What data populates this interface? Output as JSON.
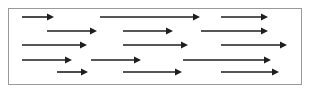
{
  "diagram": {
    "frame": {
      "x": 8,
      "y": 8,
      "width": 294,
      "height": 77,
      "border_color": "#9a9a9a"
    },
    "arrow_color": "#1e1e1e",
    "direction": "right",
    "rows": [
      {
        "y": 17,
        "arrows": [
          {
            "x1": 22,
            "x2": 54
          },
          {
            "x1": 100,
            "x2": 200
          },
          {
            "x1": 221,
            "x2": 268
          }
        ]
      },
      {
        "y": 31,
        "arrows": [
          {
            "x1": 47,
            "x2": 97
          },
          {
            "x1": 123,
            "x2": 173
          },
          {
            "x1": 201,
            "x2": 268
          }
        ]
      },
      {
        "y": 45,
        "arrows": [
          {
            "x1": 22,
            "x2": 87
          },
          {
            "x1": 123,
            "x2": 188
          },
          {
            "x1": 221,
            "x2": 287
          }
        ]
      },
      {
        "y": 60,
        "arrows": [
          {
            "x1": 22,
            "x2": 72
          },
          {
            "x1": 91,
            "x2": 141
          },
          {
            "x1": 183,
            "x2": 271
          }
        ]
      },
      {
        "y": 72,
        "arrows": [
          {
            "x1": 57,
            "x2": 88
          },
          {
            "x1": 123,
            "x2": 182
          },
          {
            "x1": 221,
            "x2": 279
          }
        ]
      }
    ]
  }
}
